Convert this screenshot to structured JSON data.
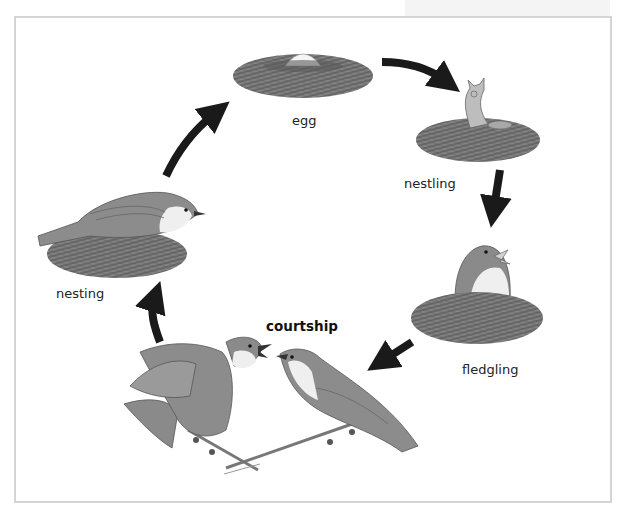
{
  "diagram": {
    "stages": [
      {
        "id": "egg",
        "label": "egg"
      },
      {
        "id": "nestling",
        "label": "nestling"
      },
      {
        "id": "fledgling",
        "label": "fledgling"
      },
      {
        "id": "courtship",
        "label": "courtship"
      },
      {
        "id": "nesting",
        "label": "nesting"
      }
    ],
    "flow": [
      "egg",
      "nestling",
      "fledgling",
      "courtship",
      "nesting",
      "egg"
    ],
    "colors": {
      "arrow": "#1a1a1a",
      "nest": "#6e6e6e",
      "nest_dark": "#4a4a4a",
      "bird_body": "#8a8a8a",
      "bird_breast": "#e8e8e8",
      "frame_border": "#d4d4d4"
    }
  }
}
